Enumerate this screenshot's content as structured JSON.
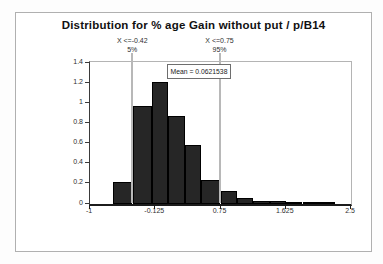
{
  "title": "Distribution for % age Gain without put / p/B14",
  "mean_box": {
    "label": "Mean = 0.0621538"
  },
  "delimiters": [
    {
      "line1": "X <=-0.42",
      "line2": "5%",
      "x": -0.42
    },
    {
      "line1": "X <=0.75",
      "line2": "95%",
      "x": 0.75
    }
  ],
  "colors": {
    "bar_fill": "#262626",
    "bar_border": "#000000",
    "delimiter_line": "#b8b8b8",
    "frame_border": "#b0b0b0",
    "axis_line": "#1c1c1c",
    "text": "#2e2e2e"
  },
  "chart_data": {
    "type": "bar",
    "subtype": "histogram",
    "title": "Distribution for % age Gain without put / p/B14",
    "xlabel": "",
    "ylabel": "",
    "xlim": [
      -1,
      2.5
    ],
    "ylim": [
      0,
      1.4
    ],
    "grid": false,
    "legend": "none",
    "mean": 0.0621538,
    "percentile_markers": [
      {
        "percent": "5%",
        "x": -0.42
      },
      {
        "percent": "95%",
        "x": 0.75
      }
    ],
    "x_ticks": [
      {
        "value": -1,
        "label": "-1"
      },
      {
        "value": -0.125,
        "label": "-0.125"
      },
      {
        "value": 0.75,
        "label": "0.75"
      },
      {
        "value": 1.625,
        "label": "1.625"
      },
      {
        "value": 2.5,
        "label": "2.5"
      }
    ],
    "y_ticks": [
      {
        "value": 0,
        "label": "0"
      },
      {
        "value": 0.2,
        "label": "0.2"
      },
      {
        "value": 0.4,
        "label": "0.4"
      },
      {
        "value": 0.6,
        "label": "0.6"
      },
      {
        "value": 0.8,
        "label": "0.8"
      },
      {
        "value": 1,
        "label": "1"
      },
      {
        "value": 1.2,
        "label": "1.2"
      },
      {
        "value": 1.4,
        "label": "1.4"
      }
    ],
    "bins": [
      {
        "start": -0.69,
        "end": -0.43,
        "height": 0.21
      },
      {
        "start": -0.42,
        "end": -0.17,
        "height": 0.97
      },
      {
        "start": -0.17,
        "end": 0.05,
        "height": 1.21
      },
      {
        "start": 0.05,
        "end": 0.27,
        "height": 0.87
      },
      {
        "start": 0.27,
        "end": 0.49,
        "height": 0.58
      },
      {
        "start": 0.49,
        "end": 0.75,
        "height": 0.23
      },
      {
        "start": 0.75,
        "end": 0.97,
        "height": 0.12
      },
      {
        "start": 0.97,
        "end": 1.19,
        "height": 0.06
      },
      {
        "start": 1.19,
        "end": 1.41,
        "height": 0.03
      },
      {
        "start": 1.41,
        "end": 1.63,
        "height": 0.025
      },
      {
        "start": 1.63,
        "end": 1.85,
        "height": 0.017
      },
      {
        "start": 1.85,
        "end": 2.07,
        "height": 0.01
      },
      {
        "start": 2.07,
        "end": 2.29,
        "height": 0.008
      }
    ]
  }
}
